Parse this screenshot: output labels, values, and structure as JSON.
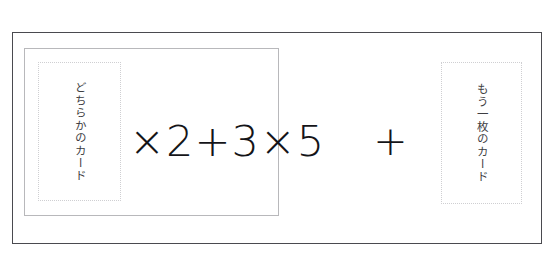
{
  "page": {
    "background_color": "#ffffff",
    "frame_border_color": "#4a4a4f",
    "panel_border_color": "#b8b8bb",
    "card_border_color": "#cfcfd2",
    "text_color": "#141418"
  },
  "card_slots": [
    {
      "id": "left",
      "label": "どちらかのカード",
      "orientation": "vertical"
    },
    {
      "id": "right",
      "label": "もう一枚のカード",
      "orientation": "vertical"
    }
  ],
  "formula": {
    "expression": "×2+3×5",
    "operator": "+",
    "terms": [
      "×2",
      "+",
      "3",
      "×5"
    ],
    "trailing_operator": "+"
  }
}
